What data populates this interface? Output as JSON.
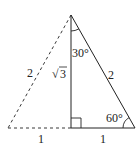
{
  "diagram": {
    "colors": {
      "stroke": "#222222",
      "background": "#ffffff"
    },
    "labels": {
      "left_hypotenuse": "2",
      "right_hypotenuse": "2",
      "altitude_root": "3",
      "altitude_radical": "√",
      "angle_top": "30°",
      "angle_right": "60°",
      "base_left": "1",
      "base_right": "1"
    }
  }
}
